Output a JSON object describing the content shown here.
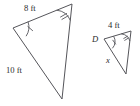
{
  "figure": {
    "type": "geometry-diagram",
    "background_color": "#ffffff",
    "stroke_color": "#55555a",
    "text_color": "#2b2b2b",
    "large_triangle": {
      "name": "large-triangle",
      "vertices": [
        {
          "name": "left-vertex",
          "x": 13,
          "y": 28,
          "angle_marks": 1
        },
        {
          "name": "top-right-vertex",
          "x": 72,
          "y": 4,
          "angle_marks": 2
        },
        {
          "name": "bottom-vertex",
          "x": 62,
          "y": 99,
          "angle_marks": 0
        }
      ],
      "labels": {
        "top_side": "8 ft",
        "left_side": "10 ft"
      }
    },
    "small_triangle": {
      "name": "small-triangle",
      "vertices": [
        {
          "name": "vertex-d",
          "x": 104,
          "y": 39,
          "angle_marks": 1,
          "label": "D"
        },
        {
          "name": "top-right-vertex",
          "x": 131,
          "y": 31,
          "angle_marks": 2
        },
        {
          "name": "bottom-vertex",
          "x": 126,
          "y": 74,
          "angle_marks": 0
        }
      ],
      "labels": {
        "top_side": "4 ft",
        "left_side": "x",
        "vertex_d": "D"
      }
    },
    "text_items": [
      {
        "name": "label-8-ft",
        "text": "8 ft",
        "x": 24,
        "y": 11,
        "style": "upright"
      },
      {
        "name": "label-10-ft",
        "text": "10 ft",
        "x": 6,
        "y": 73,
        "style": "upright"
      },
      {
        "name": "label-4-ft",
        "text": "4 ft",
        "x": 108,
        "y": 28,
        "style": "upright"
      },
      {
        "name": "label-vertex-d",
        "text": "D",
        "x": 92,
        "y": 42,
        "style": "italic"
      },
      {
        "name": "label-x",
        "text": "x",
        "x": 106,
        "y": 63,
        "style": "italic"
      }
    ]
  }
}
